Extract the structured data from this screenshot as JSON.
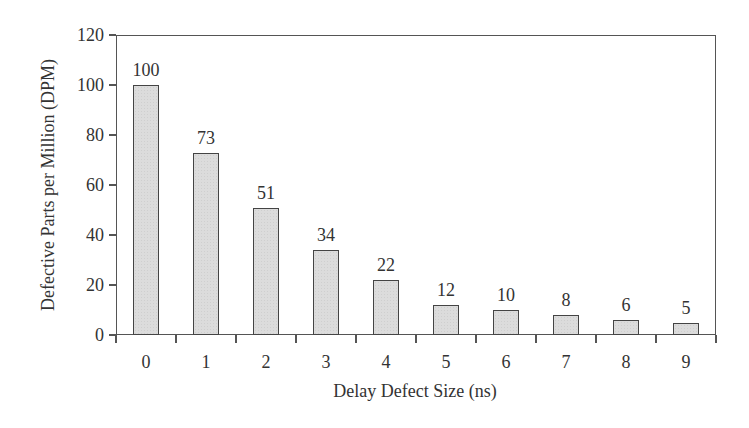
{
  "chart_data": {
    "type": "bar",
    "title": "",
    "xlabel": "Delay Defect Size (ns)",
    "ylabel": "Defective Parts per Million (DPM)",
    "categories": [
      "0",
      "1",
      "2",
      "3",
      "4",
      "5",
      "6",
      "7",
      "8",
      "9"
    ],
    "values": [
      100,
      73,
      51,
      34,
      22,
      12,
      10,
      8,
      6,
      5
    ],
    "data_labels": [
      "100",
      "73",
      "51",
      "34",
      "22",
      "12",
      "10",
      "8",
      "6",
      "5"
    ],
    "ylim": [
      0,
      120
    ],
    "yticks": [
      0,
      20,
      40,
      60,
      80,
      100,
      120
    ],
    "grid": false,
    "legend": null,
    "bar_color": "#dcdcdc",
    "bar_edge_color": "#444444"
  },
  "axes": {
    "x_title": "Delay Defect Size (ns)",
    "y_title": "Defective Parts per Million (DPM)",
    "y_tick_labels": [
      "0",
      "20",
      "40",
      "60",
      "80",
      "100",
      "120"
    ]
  }
}
